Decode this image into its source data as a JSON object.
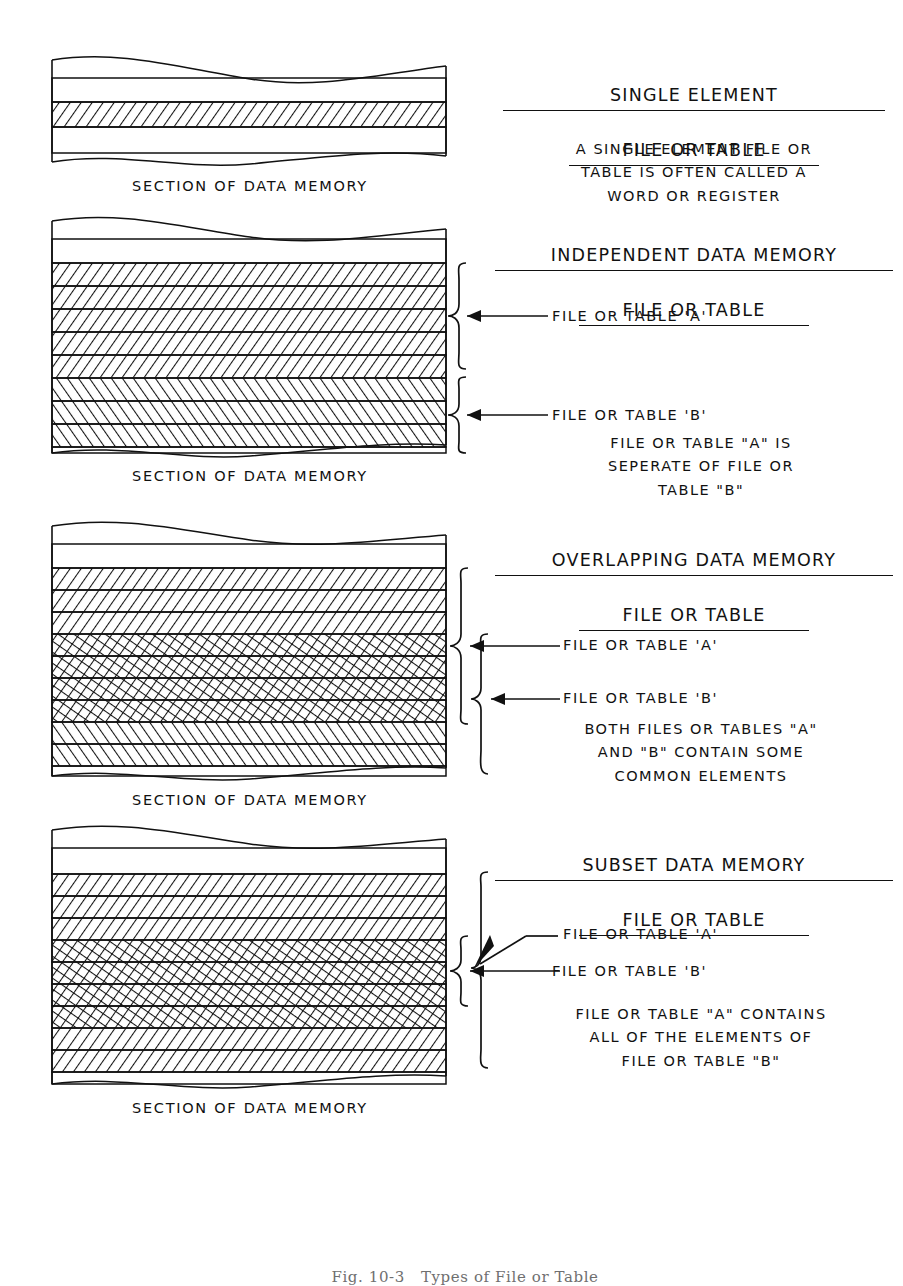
{
  "figure": {
    "caption": "Fig. 10-3   Types of File or Table",
    "ink_color": "#111111",
    "background": "#ffffff"
  },
  "sections": [
    {
      "id": "single-element",
      "heading_line1": "SINGLE ELEMENT",
      "heading_line2": "FILE OR TABLE",
      "description": "A SINGLE ELEMENT FILE OR\nTABLE IS OFTEN CALLED A\nWORD OR REGISTER",
      "memory_caption": "SECTION OF DATA MEMORY",
      "rows": [
        {
          "fill": "none"
        },
        {
          "fill": "hatch-right"
        },
        {
          "fill": "none"
        }
      ],
      "callouts": [],
      "braces": []
    },
    {
      "id": "independent",
      "heading_line1": "INDEPENDENT DATA MEMORY",
      "heading_line2": "FILE OR TABLE",
      "description": "FILE OR TABLE \"A\" IS\nSEPERATE OF FILE OR\nTABLE \"B\"",
      "memory_caption": "SECTION OF DATA MEMORY",
      "rows": [
        {
          "fill": "none"
        },
        {
          "fill": "hatch-right"
        },
        {
          "fill": "hatch-right"
        },
        {
          "fill": "hatch-right"
        },
        {
          "fill": "hatch-right"
        },
        {
          "fill": "hatch-right"
        },
        {
          "fill": "hatch-left"
        },
        {
          "fill": "hatch-left"
        },
        {
          "fill": "hatch-left"
        },
        {
          "fill": "none"
        }
      ],
      "callouts": [
        {
          "label": "FILE OR TABLE 'A'"
        },
        {
          "label": "FILE OR TABLE 'B'"
        }
      ],
      "braces": [
        {
          "target": "A"
        },
        {
          "target": "B"
        }
      ]
    },
    {
      "id": "overlapping",
      "heading_line1": "OVERLAPPING DATA MEMORY",
      "heading_line2": "FILE OR TABLE",
      "description": "BOTH FILES OR TABLES \"A\"\nAND \"B\" CONTAIN SOME\nCOMMON ELEMENTS",
      "memory_caption": "SECTION OF DATA MEMORY",
      "rows": [
        {
          "fill": "none"
        },
        {
          "fill": "hatch-right"
        },
        {
          "fill": "hatch-right"
        },
        {
          "fill": "hatch-right"
        },
        {
          "fill": "cross"
        },
        {
          "fill": "cross"
        },
        {
          "fill": "cross"
        },
        {
          "fill": "cross"
        },
        {
          "fill": "hatch-left"
        },
        {
          "fill": "hatch-left"
        },
        {
          "fill": "none"
        }
      ],
      "callouts": [
        {
          "label": "FILE OR TABLE 'A'"
        },
        {
          "label": "FILE OR TABLE 'B'"
        }
      ],
      "braces": [
        {
          "target": "A"
        },
        {
          "target": "B"
        }
      ]
    },
    {
      "id": "subset",
      "heading_line1": "SUBSET DATA MEMORY",
      "heading_line2": "FILE OR TABLE",
      "description": "FILE OR TABLE \"A\" CONTAINS\nALL OF THE ELEMENTS OF\nFILE OR TABLE \"B\"",
      "memory_caption": "SECTION OF DATA MEMORY",
      "rows": [
        {
          "fill": "none"
        },
        {
          "fill": "hatch-right"
        },
        {
          "fill": "hatch-right"
        },
        {
          "fill": "hatch-right"
        },
        {
          "fill": "cross"
        },
        {
          "fill": "cross"
        },
        {
          "fill": "cross"
        },
        {
          "fill": "cross"
        },
        {
          "fill": "hatch-right"
        },
        {
          "fill": "hatch-right"
        },
        {
          "fill": "hatch-right"
        },
        {
          "fill": "none"
        }
      ],
      "callouts": [
        {
          "label": "FILE OR TABLE 'A'"
        },
        {
          "label": "FILE OR TABLE 'B'"
        }
      ],
      "braces": [
        {
          "target": "A"
        },
        {
          "target": "B"
        }
      ]
    }
  ]
}
